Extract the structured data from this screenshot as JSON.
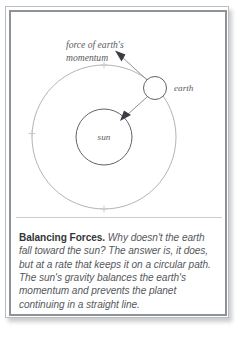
{
  "figure": {
    "diagram": {
      "force_label_line1": "force of earth's",
      "force_label_line2": "momentum",
      "earth_label": "earth",
      "sun_label": "sun",
      "arrow_momentum_name": "momentum-force-arrow",
      "arrow_gravity_name": "gravity-force-arrow",
      "orbit_name": "earth-orbit-path"
    },
    "caption": {
      "lead": "Balancing Forces.",
      "body": " Why doesn't the earth fall toward the sun? The answer is, it does, but at a rate that keeps it on a circular path. The sun's gravity balances the earth's momentum and prevents the planet continuing in a straight line."
    },
    "colors": {
      "ink": "#55585d",
      "lead_ink": "#33363a",
      "orbit_stroke": "#a9acb1",
      "body_stroke": "#5f6266",
      "arrow_stroke": "#8d9094",
      "frame_outer": "#b9bcc0",
      "frame_inner": "#8f9296",
      "rule": "#c9ccd0",
      "page": "#ffffff"
    }
  }
}
